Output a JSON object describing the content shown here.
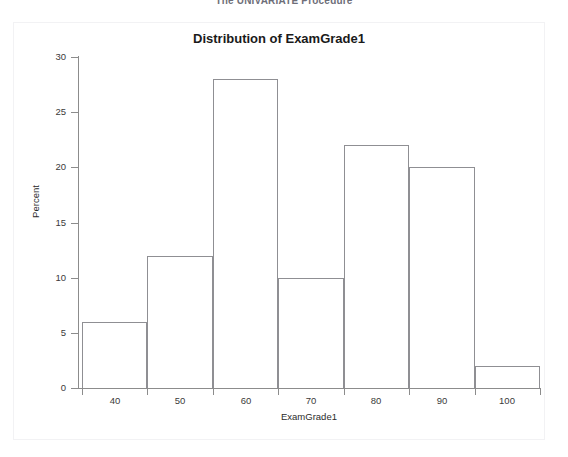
{
  "page": {
    "procedure_header": "The UNIVARIATE Procedure"
  },
  "chart_data": {
    "type": "bar",
    "title": "Distribution of ExamGrade1",
    "subtitle": "",
    "xlabel": "ExamGrade1",
    "ylabel": "Percent",
    "xlim": [
      35,
      105
    ],
    "ylim": [
      0,
      30
    ],
    "grid": false,
    "legend": "none",
    "bin_width": 10,
    "bin_edges": [
      35,
      45,
      55,
      65,
      75,
      85,
      95,
      105
    ],
    "categories": [
      "35-45",
      "45-55",
      "55-65",
      "65-75",
      "75-85",
      "85-95",
      "95-105"
    ],
    "bin_midpoints": [
      40,
      50,
      60,
      70,
      80,
      90,
      100
    ],
    "values": [
      6,
      12,
      28,
      10,
      22,
      20,
      2
    ],
    "x_ticks": [
      40,
      50,
      60,
      70,
      80,
      90,
      100
    ],
    "x_tick_labels": [
      "40",
      "50",
      "60",
      "70",
      "80",
      "90",
      "100"
    ],
    "y_ticks": [
      0,
      5,
      10,
      15,
      20,
      25,
      30
    ],
    "y_tick_labels": [
      "0",
      "5",
      "10",
      "15",
      "20",
      "25",
      "30"
    ],
    "bar_fill_color": "#ffffff",
    "bar_edge_color": "#8f8f93",
    "axis_color": "#8c8c8c",
    "background_color": "#ffffff"
  }
}
